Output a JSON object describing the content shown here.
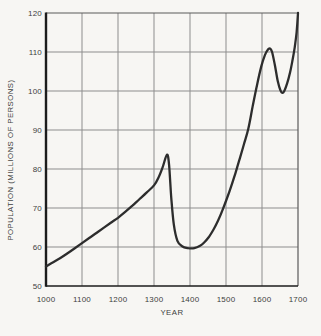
{
  "chart_data": {
    "type": "line",
    "title": "",
    "xlabel": "YEAR",
    "ylabel": "POPULATION (MILLIONS OF PERSONS)",
    "xlim": [
      1000,
      1700
    ],
    "ylim": [
      50,
      120
    ],
    "x_ticks": [
      1000,
      1100,
      1200,
      1300,
      1400,
      1500,
      1600,
      1700
    ],
    "y_ticks": [
      50,
      60,
      70,
      80,
      90,
      100,
      110,
      120
    ],
    "grid": true,
    "legend": "none",
    "series": [
      {
        "name": "population",
        "points": [
          [
            1000,
            55.0
          ],
          [
            1020,
            56.1
          ],
          [
            1040,
            57.2
          ],
          [
            1060,
            58.4
          ],
          [
            1080,
            59.7
          ],
          [
            1100,
            61.0
          ],
          [
            1120,
            62.3
          ],
          [
            1140,
            63.6
          ],
          [
            1160,
            64.9
          ],
          [
            1180,
            66.2
          ],
          [
            1200,
            67.5
          ],
          [
            1220,
            69.0
          ],
          [
            1240,
            70.6
          ],
          [
            1260,
            72.3
          ],
          [
            1280,
            74.0
          ],
          [
            1300,
            75.8
          ],
          [
            1312,
            77.7
          ],
          [
            1324,
            80.4
          ],
          [
            1336,
            83.7
          ],
          [
            1342,
            81.0
          ],
          [
            1348,
            72.5
          ],
          [
            1355,
            65.8
          ],
          [
            1365,
            61.6
          ],
          [
            1378,
            60.2
          ],
          [
            1395,
            59.7
          ],
          [
            1412,
            59.7
          ],
          [
            1428,
            60.3
          ],
          [
            1440,
            61.2
          ],
          [
            1452,
            62.5
          ],
          [
            1465,
            64.4
          ],
          [
            1478,
            66.8
          ],
          [
            1490,
            69.4
          ],
          [
            1502,
            72.3
          ],
          [
            1514,
            75.4
          ],
          [
            1526,
            78.9
          ],
          [
            1538,
            82.6
          ],
          [
            1550,
            86.4
          ],
          [
            1562,
            90.3
          ],
          [
            1574,
            96.0
          ],
          [
            1586,
            101.5
          ],
          [
            1598,
            106.3
          ],
          [
            1608,
            109.2
          ],
          [
            1616,
            110.6
          ],
          [
            1622,
            110.9
          ],
          [
            1628,
            110.0
          ],
          [
            1636,
            106.5
          ],
          [
            1644,
            102.5
          ],
          [
            1651,
            100.2
          ],
          [
            1656,
            99.5
          ],
          [
            1662,
            100.0
          ],
          [
            1670,
            102.0
          ],
          [
            1678,
            104.8
          ],
          [
            1685,
            108.0
          ],
          [
            1691,
            111.3
          ],
          [
            1696,
            115.0
          ],
          [
            1700,
            120.0
          ]
        ]
      }
    ]
  },
  "colors": {
    "background": "#f7f6f3",
    "grid": "#8d8d8d",
    "frame_light": "#5a5a5a",
    "frame_dark": "#1c1c1c",
    "curve": "#2d2d2d",
    "text": "#3e3e3e"
  }
}
